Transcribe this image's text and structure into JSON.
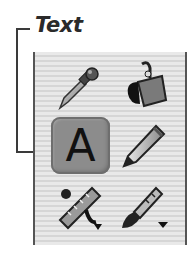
{
  "callout": {
    "label": "Text"
  },
  "toolbox": {
    "tools": [
      {
        "name": "eyedropper",
        "icon": "eyedropper-icon",
        "selected": false
      },
      {
        "name": "paint-bucket",
        "icon": "paint-bucket-icon",
        "selected": false
      },
      {
        "name": "text",
        "icon": "text-icon",
        "glyph": "A",
        "selected": true
      },
      {
        "name": "pencil",
        "icon": "pencil-icon",
        "selected": false
      },
      {
        "name": "measure",
        "icon": "ruler-icon",
        "selected": false,
        "has_submenu": true
      },
      {
        "name": "brush",
        "icon": "brush-icon",
        "selected": false,
        "has_submenu": true
      }
    ]
  },
  "colors": {
    "panel_stripe_light": "#e9e9e9",
    "panel_stripe_dark": "#d6d6d6",
    "selected_fill": "#8c8c8c",
    "line": "#3a3a3a"
  }
}
